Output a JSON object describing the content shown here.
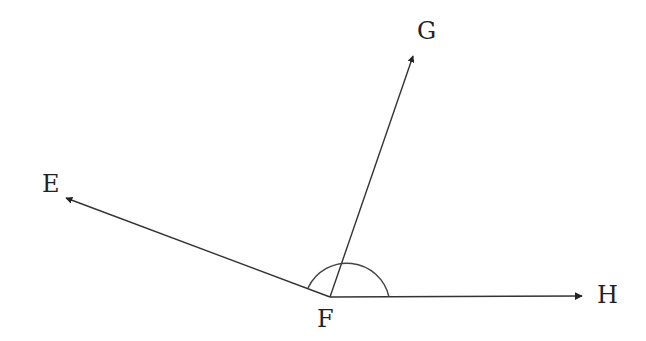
{
  "diagram": {
    "type": "angle-rays",
    "vertex": {
      "label": "F",
      "x": 330,
      "y": 297
    },
    "rays": [
      {
        "label": "E",
        "tip": {
          "x": 66,
          "y": 198
        }
      },
      {
        "label": "G",
        "tip": {
          "x": 413,
          "y": 56
        }
      },
      {
        "label": "H",
        "tip": {
          "x": 582,
          "y": 296
        }
      }
    ],
    "arc": {
      "center": {
        "x": 346,
        "y": 297
      },
      "radius": 43,
      "description": "angle arc marking angle EFH"
    },
    "colors": {
      "stroke": "#333333",
      "text": "#222222",
      "background": "#ffffff"
    }
  },
  "labels": {
    "E": "E",
    "F": "F",
    "G": "G",
    "H": "H"
  }
}
